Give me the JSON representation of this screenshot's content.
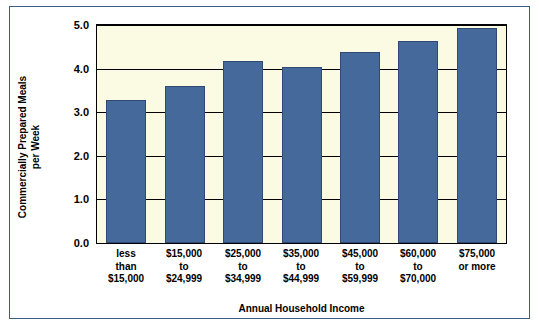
{
  "chart_data": {
    "type": "bar",
    "title": "",
    "xlabel": "Annual Household Income",
    "ylabel": "Commercially Prepared Meals per Week",
    "categories": [
      "less\nthan\n$15,000",
      "$15,000\nto\n$24,999",
      "$25,000\nto\n$34,999",
      "$35,000\nto\n$44,999",
      "$45,000\nto\n$59,999",
      "$60,000\nto\n$70,000",
      "$75,000\nor more"
    ],
    "values": [
      3.28,
      3.6,
      4.17,
      4.03,
      4.37,
      4.63,
      4.93
    ],
    "ylim": [
      0.0,
      5.0
    ],
    "yticks": [
      "0.0",
      "1.0",
      "2.0",
      "3.0",
      "4.0",
      "5.0"
    ],
    "ytick_values": [
      0.0,
      1.0,
      2.0,
      3.0,
      4.0,
      5.0
    ],
    "grid": true,
    "legend": "none",
    "colors": {
      "bar": "#46699c",
      "bar_border": "#2e4a74",
      "plot_background": "#fbfbe4",
      "frame_border": "#3b5c86",
      "axis": "#000000"
    }
  }
}
